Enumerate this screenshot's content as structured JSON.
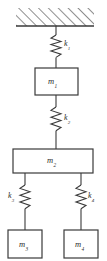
{
  "figure": {
    "type": "mechanical-schematic",
    "stroke_color": "#3a3a3a",
    "background_color": "#ffffff",
    "label_color": "#2b2b2b"
  },
  "support": {
    "name": "fixed-support",
    "hatching": "diagonal",
    "x": 16,
    "y": 8,
    "width": 78,
    "height": 18
  },
  "masses": [
    {
      "id": "m1",
      "symbol": "m",
      "subscript": "1",
      "x": 35,
      "y": 68,
      "width": 43,
      "height": 27
    },
    {
      "id": "m2",
      "symbol": "m",
      "subscript": "2",
      "x": 13,
      "y": 149,
      "width": 80,
      "height": 24
    },
    {
      "id": "m3",
      "symbol": "m",
      "subscript": "3",
      "x": 8,
      "y": 230,
      "width": 34,
      "height": 28
    },
    {
      "id": "m4",
      "symbol": "m",
      "subscript": "4",
      "x": 64,
      "y": 230,
      "width": 34,
      "height": 28
    }
  ],
  "springs": [
    {
      "id": "k1",
      "symbol": "k",
      "subscript": "1",
      "cx": 56,
      "top": 26,
      "bottom": 68,
      "label_side": "right",
      "label_x": 62,
      "label_y": 42
    },
    {
      "id": "k2",
      "symbol": "k",
      "subscript": "2",
      "cx": 56,
      "top": 95,
      "bottom": 149,
      "label_side": "right",
      "label_x": 62,
      "label_y": 118
    },
    {
      "id": "k3",
      "symbol": "k",
      "subscript": "3",
      "cx": 25,
      "top": 173,
      "bottom": 230,
      "label_side": "left",
      "label_x": 9,
      "label_y": 196
    },
    {
      "id": "k4",
      "symbol": "k",
      "subscript": "4",
      "cx": 81,
      "top": 173,
      "bottom": 230,
      "label_side": "right",
      "label_x": 87,
      "label_y": 196
    }
  ]
}
